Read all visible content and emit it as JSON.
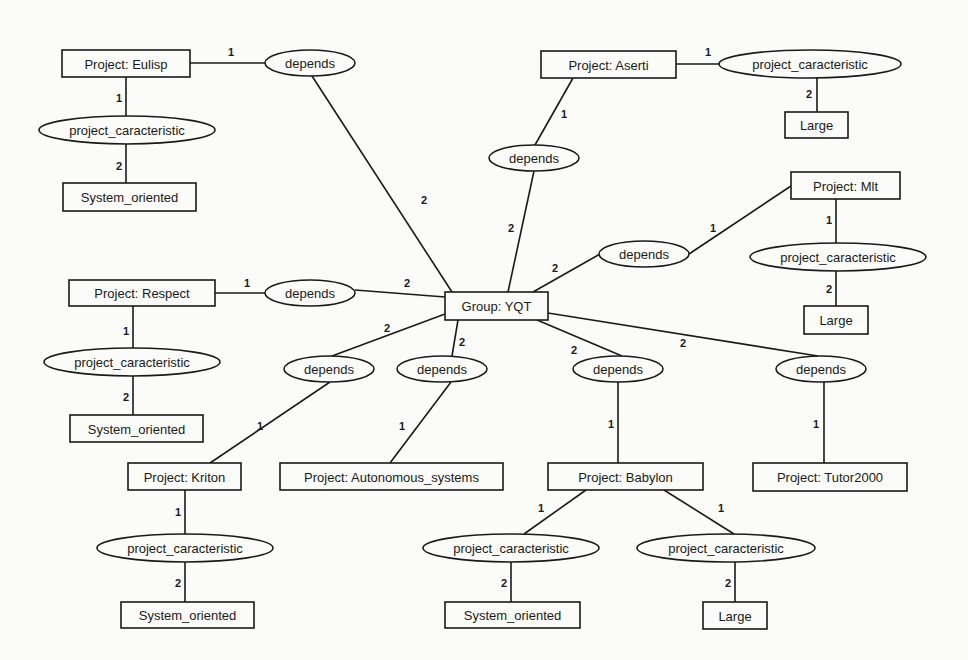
{
  "diagram": {
    "title": "",
    "entities": [
      {
        "id": "eulisp",
        "label": "Project: Eulisp",
        "x": 62,
        "y": 50,
        "w": 128,
        "h": 27
      },
      {
        "id": "eulisp_so",
        "label": "System_oriented",
        "x": 63,
        "y": 183,
        "w": 133,
        "h": 28
      },
      {
        "id": "aserti",
        "label": "Project: Aserti",
        "x": 541,
        "y": 51,
        "w": 135,
        "h": 27
      },
      {
        "id": "aserti_large",
        "label": "Large",
        "x": 785,
        "y": 112,
        "w": 63,
        "h": 26
      },
      {
        "id": "mlt",
        "label": "Project: Mlt",
        "x": 791,
        "y": 172,
        "w": 109,
        "h": 27
      },
      {
        "id": "mlt_large",
        "label": "Large",
        "x": 804,
        "y": 306,
        "w": 64,
        "h": 28
      },
      {
        "id": "respect",
        "label": "Project: Respect",
        "x": 69,
        "y": 280,
        "w": 146,
        "h": 26
      },
      {
        "id": "respect_so",
        "label": "System_oriented",
        "x": 70,
        "y": 415,
        "w": 133,
        "h": 27
      },
      {
        "id": "group",
        "label": "Group: YQT",
        "x": 445,
        "y": 292,
        "w": 103,
        "h": 28
      },
      {
        "id": "kriton",
        "label": "Project: Kriton",
        "x": 128,
        "y": 463,
        "w": 113,
        "h": 27
      },
      {
        "id": "autonomous",
        "label": "Project: Autonomous_systems",
        "x": 280,
        "y": 463,
        "w": 223,
        "h": 27
      },
      {
        "id": "babylon",
        "label": "Project: Babylon",
        "x": 548,
        "y": 463,
        "w": 155,
        "h": 27
      },
      {
        "id": "tutor",
        "label": "Project: Tutor2000",
        "x": 753,
        "y": 463,
        "w": 154,
        "h": 28
      },
      {
        "id": "kriton_so",
        "label": "System_oriented",
        "x": 121,
        "y": 602,
        "w": 133,
        "h": 26
      },
      {
        "id": "babylon_so",
        "label": "System_oriented",
        "x": 445,
        "y": 602,
        "w": 135,
        "h": 26
      },
      {
        "id": "babylon_large",
        "label": "Large",
        "x": 703,
        "y": 602,
        "w": 64,
        "h": 27
      }
    ],
    "relations": [
      {
        "id": "r_eulisp_dep",
        "label": "depends",
        "cx": 310,
        "cy": 63,
        "rx": 45,
        "ry": 13
      },
      {
        "id": "r_eulisp_pc",
        "label": "project_caracteristic",
        "cx": 127,
        "cy": 130,
        "rx": 88,
        "ry": 14
      },
      {
        "id": "r_aserti_pc",
        "label": "project_caracteristic",
        "cx": 810,
        "cy": 64,
        "rx": 91,
        "ry": 14
      },
      {
        "id": "r_aserti_dep",
        "label": "depends",
        "cx": 534,
        "cy": 158,
        "rx": 45,
        "ry": 13
      },
      {
        "id": "r_mlt_pc",
        "label": "project_caracteristic",
        "cx": 838,
        "cy": 257,
        "rx": 88,
        "ry": 14
      },
      {
        "id": "r_mlt_dep",
        "label": "depends",
        "cx": 644,
        "cy": 254,
        "rx": 45,
        "ry": 13
      },
      {
        "id": "r_respect_dep",
        "label": "depends",
        "cx": 310,
        "cy": 293,
        "rx": 45,
        "ry": 13
      },
      {
        "id": "r_respect_pc",
        "label": "project_caracteristic",
        "cx": 132,
        "cy": 362,
        "rx": 88,
        "ry": 14
      },
      {
        "id": "r_kriton_dep",
        "label": "depends",
        "cx": 329,
        "cy": 369,
        "rx": 45,
        "ry": 13
      },
      {
        "id": "r_auto_dep",
        "label": "depends",
        "cx": 442,
        "cy": 369,
        "rx": 45,
        "ry": 13
      },
      {
        "id": "r_babylon_dep",
        "label": "depends",
        "cx": 618,
        "cy": 369,
        "rx": 45,
        "ry": 13
      },
      {
        "id": "r_tutor_dep",
        "label": "depends",
        "cx": 821,
        "cy": 369,
        "rx": 45,
        "ry": 13
      },
      {
        "id": "r_kriton_pc",
        "label": "project_caracteristic",
        "cx": 185,
        "cy": 548,
        "rx": 88,
        "ry": 14
      },
      {
        "id": "r_babylon_pc1",
        "label": "project_caracteristic",
        "cx": 511,
        "cy": 548,
        "rx": 88,
        "ry": 14
      },
      {
        "id": "r_babylon_pc2",
        "label": "project_caracteristic",
        "cx": 726,
        "cy": 548,
        "rx": 89,
        "ry": 14
      }
    ],
    "edges": [
      {
        "x1": 190,
        "y1": 63,
        "x2": 265,
        "y2": 63,
        "card": "1",
        "lx": 228,
        "ly": 56
      },
      {
        "x1": 312,
        "y1": 76,
        "x2": 452,
        "y2": 292,
        "card": "2",
        "lx": 421,
        "ly": 204
      },
      {
        "x1": 126,
        "y1": 77,
        "x2": 126,
        "y2": 116,
        "card": "1",
        "lx": 116,
        "ly": 102
      },
      {
        "x1": 126,
        "y1": 144,
        "x2": 126,
        "y2": 183,
        "card": "2",
        "lx": 116,
        "ly": 170
      },
      {
        "x1": 676,
        "y1": 64,
        "x2": 719,
        "y2": 64,
        "card": "1",
        "lx": 705,
        "ly": 56
      },
      {
        "x1": 817,
        "y1": 78,
        "x2": 817,
        "y2": 112,
        "card": "2",
        "lx": 806,
        "ly": 98
      },
      {
        "x1": 573,
        "y1": 78,
        "x2": 535,
        "y2": 145,
        "card": "1",
        "lx": 561,
        "ly": 118
      },
      {
        "x1": 534,
        "y1": 171,
        "x2": 508,
        "y2": 292,
        "card": "2",
        "lx": 508,
        "ly": 232
      },
      {
        "x1": 791,
        "y1": 186,
        "x2": 689,
        "y2": 254,
        "card": "1",
        "lx": 710,
        "ly": 232
      },
      {
        "x1": 600,
        "y1": 254,
        "x2": 533,
        "y2": 292,
        "card": "2",
        "lx": 552,
        "ly": 272
      },
      {
        "x1": 836,
        "y1": 199,
        "x2": 836,
        "y2": 243,
        "card": "1",
        "lx": 826,
        "ly": 224
      },
      {
        "x1": 836,
        "y1": 271,
        "x2": 836,
        "y2": 306,
        "card": "2",
        "lx": 826,
        "ly": 293
      },
      {
        "x1": 215,
        "y1": 293,
        "x2": 265,
        "y2": 293,
        "card": "1",
        "lx": 244,
        "ly": 287
      },
      {
        "x1": 355,
        "y1": 290,
        "x2": 445,
        "y2": 297,
        "card": "2",
        "lx": 404,
        "ly": 287
      },
      {
        "x1": 133,
        "y1": 306,
        "x2": 133,
        "y2": 348,
        "card": "1",
        "lx": 123,
        "ly": 335
      },
      {
        "x1": 133,
        "y1": 376,
        "x2": 133,
        "y2": 415,
        "card": "2",
        "lx": 123,
        "ly": 401
      },
      {
        "x1": 445,
        "y1": 314,
        "x2": 332,
        "y2": 356,
        "card": "2",
        "lx": 384,
        "ly": 332
      },
      {
        "x1": 330,
        "y1": 382,
        "x2": 210,
        "y2": 463,
        "card": "1",
        "lx": 257,
        "ly": 430
      },
      {
        "x1": 458,
        "y1": 320,
        "x2": 452,
        "y2": 356,
        "card": "2",
        "lx": 459,
        "ly": 346
      },
      {
        "x1": 451,
        "y1": 382,
        "x2": 390,
        "y2": 463,
        "card": "1",
        "lx": 399,
        "ly": 430
      },
      {
        "x1": 537,
        "y1": 320,
        "x2": 622,
        "y2": 356,
        "card": "2",
        "lx": 571,
        "ly": 354
      },
      {
        "x1": 618,
        "y1": 382,
        "x2": 618,
        "y2": 463,
        "card": "1",
        "lx": 608,
        "ly": 428
      },
      {
        "x1": 548,
        "y1": 313,
        "x2": 818,
        "y2": 356,
        "card": "2",
        "lx": 680,
        "ly": 347
      },
      {
        "x1": 824,
        "y1": 382,
        "x2": 824,
        "y2": 463,
        "card": "1",
        "lx": 813,
        "ly": 428
      },
      {
        "x1": 185,
        "y1": 490,
        "x2": 185,
        "y2": 534,
        "card": "1",
        "lx": 175,
        "ly": 516
      },
      {
        "x1": 185,
        "y1": 562,
        "x2": 185,
        "y2": 602,
        "card": "2",
        "lx": 175,
        "ly": 587
      },
      {
        "x1": 586,
        "y1": 490,
        "x2": 524,
        "y2": 534,
        "card": "1",
        "lx": 538,
        "ly": 512
      },
      {
        "x1": 511,
        "y1": 562,
        "x2": 511,
        "y2": 602,
        "card": "2",
        "lx": 501,
        "ly": 587
      },
      {
        "x1": 664,
        "y1": 490,
        "x2": 734,
        "y2": 534,
        "card": "1",
        "lx": 718,
        "ly": 512
      },
      {
        "x1": 735,
        "y1": 562,
        "x2": 735,
        "y2": 602,
        "card": "2",
        "lx": 725,
        "ly": 587
      }
    ]
  }
}
